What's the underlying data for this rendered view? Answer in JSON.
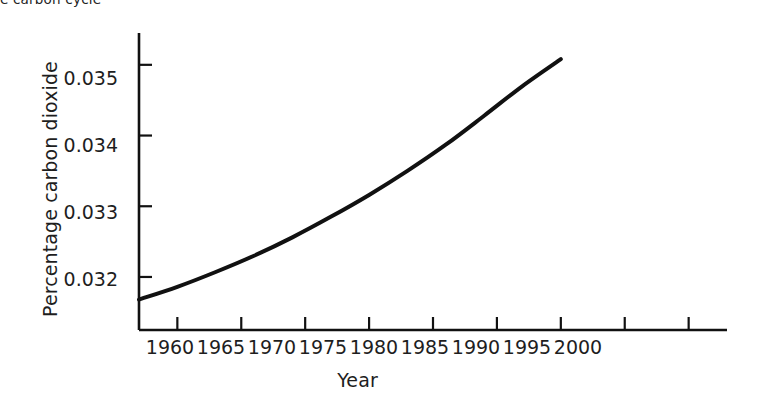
{
  "figure": {
    "caption_fragment": "e carbon cycle",
    "background_color": "#ffffff",
    "ink_color": "#111111"
  },
  "chart_data": {
    "type": "line",
    "title": "",
    "subtitle": "",
    "xlabel": "Year",
    "ylabel": "Percentage carbon dioxide",
    "xlim": [
      1957,
      2003
    ],
    "ylim": [
      0.03125,
      0.03545
    ],
    "grid": false,
    "legend": null,
    "legend_position": "none",
    "x_ticks": [
      1960,
      1965,
      1970,
      1975,
      1980,
      1985,
      1990,
      1995,
      2000
    ],
    "x_tick_labels": [
      "1960",
      "1965",
      "1970",
      "1975",
      "1980",
      "1985",
      "1990",
      "1995",
      "2000"
    ],
    "y_ticks": [
      0.032,
      0.033,
      0.034,
      0.035
    ],
    "y_tick_labels": [
      "0.032",
      "0.033",
      "0.034",
      "0.035"
    ],
    "series": [
      {
        "name": "Percentage carbon dioxide",
        "color": "#111111",
        "line_width": 4,
        "x": [
          1957,
          1960,
          1963,
          1966,
          1969,
          1972,
          1975,
          1978,
          1981,
          1984,
          1987,
          1990
        ],
        "y": [
          0.03168,
          0.03186,
          0.03207,
          0.0323,
          0.03256,
          0.03285,
          0.03316,
          0.0335,
          0.03387,
          0.03428,
          0.0347,
          0.03508
        ]
      }
    ],
    "annotations": []
  },
  "axes": {
    "x_axis_label": "Year",
    "y_axis_label": "Percentage carbon dioxide"
  }
}
